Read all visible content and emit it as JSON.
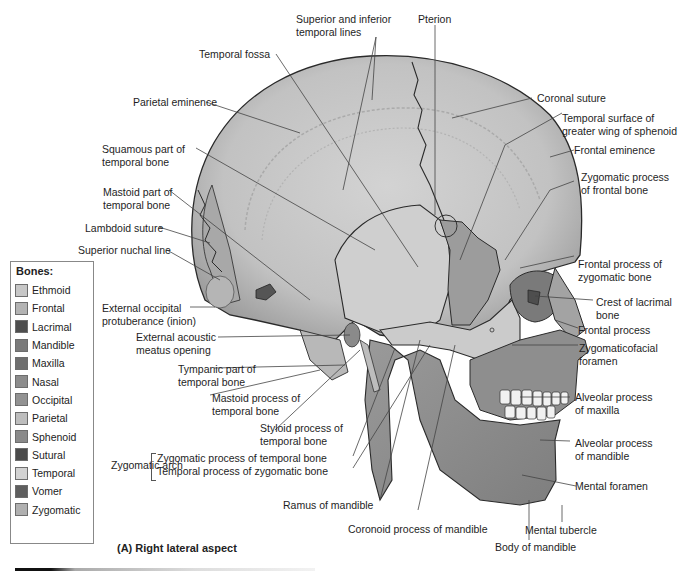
{
  "figure": {
    "caption": "(A) Right lateral aspect"
  },
  "legend": {
    "title": "Bones:",
    "items": [
      {
        "label": "Ethmoid",
        "color": "#c7c7c7"
      },
      {
        "label": "Frontal",
        "color": "#b3b3b3"
      },
      {
        "label": "Lacrimal",
        "color": "#4e4e4e"
      },
      {
        "label": "Mandible",
        "color": "#7a7a7a"
      },
      {
        "label": "Maxilla",
        "color": "#6e6e6e"
      },
      {
        "label": "Nasal",
        "color": "#8c8c8c"
      },
      {
        "label": "Occipital",
        "color": "#929292"
      },
      {
        "label": "Parietal",
        "color": "#bdbdbd"
      },
      {
        "label": "Sphenoid",
        "color": "#8a8a8a"
      },
      {
        "label": "Sutural",
        "color": "#4a4a4a"
      },
      {
        "label": "Temporal",
        "color": "#d2d2d2"
      },
      {
        "label": "Vomer",
        "color": "#5e5e5e"
      },
      {
        "label": "Zygomatic",
        "color": "#b0b0b0"
      }
    ]
  },
  "labels": {
    "superior_inferior_temporal_lines": "Superior and inferior\ntemporal lines",
    "pterion": "Pterion",
    "temporal_fossa": "Temporal fossa",
    "parietal_eminence": "Parietal eminence",
    "squamous_part": "Squamous part of\ntemporal bone",
    "mastoid_part": "Mastoid part of\ntemporal bone",
    "lambdoid_suture": "Lambdoid suture",
    "superior_nuchal_line": "Superior nuchal line",
    "external_occipital_protuberance": "External occipital\nprotuberance (inion)",
    "external_acoustic_meatus": "External acoustic\nmeatus opening",
    "tympanic_part": "Tympanic part of\ntemporal bone",
    "mastoid_process": "Mastoid process of\ntemporal bone",
    "styloid_process": "Styloid process of\ntemporal bone",
    "zygomatic_arch": "Zygomatic arch",
    "zygomatic_process_temporal": "Zygomatic process of temporal bone",
    "temporal_process_zygomatic": "Temporal process of zygomatic bone",
    "ramus_of_mandible": "Ramus of mandible",
    "coronoid_process": "Coronoid process of mandible",
    "coronal_suture": "Coronal suture",
    "temporal_surface_sphenoid": "Temporal surface of\ngreater wing of sphenoid",
    "frontal_eminence": "Frontal eminence",
    "zygomatic_process_frontal": "Zygomatic process\nof frontal bone",
    "frontal_process_zygomatic": "Frontal process of\nzygomatic bone",
    "crest_of_lacrimal": "Crest of lacrimal\nbone",
    "frontal_process": "Frontal process",
    "zygomaticofacial_foramen": "Zygomaticofacial\nforamen",
    "alveolar_process_maxilla": "Alveolar process\nof maxilla",
    "alveolar_process_mandible": "Alveolar process\nof mandible",
    "mental_foramen": "Mental foramen",
    "mental_tubercle": "Mental tubercle",
    "body_of_mandible": "Body of mandible"
  },
  "colors": {
    "background": "#ffffff",
    "bone_light": "#c9c9c9",
    "bone_mid": "#a9a9a9",
    "bone_dark": "#6f6f6f",
    "outline": "#2a2a2a",
    "leader": "#444444"
  }
}
